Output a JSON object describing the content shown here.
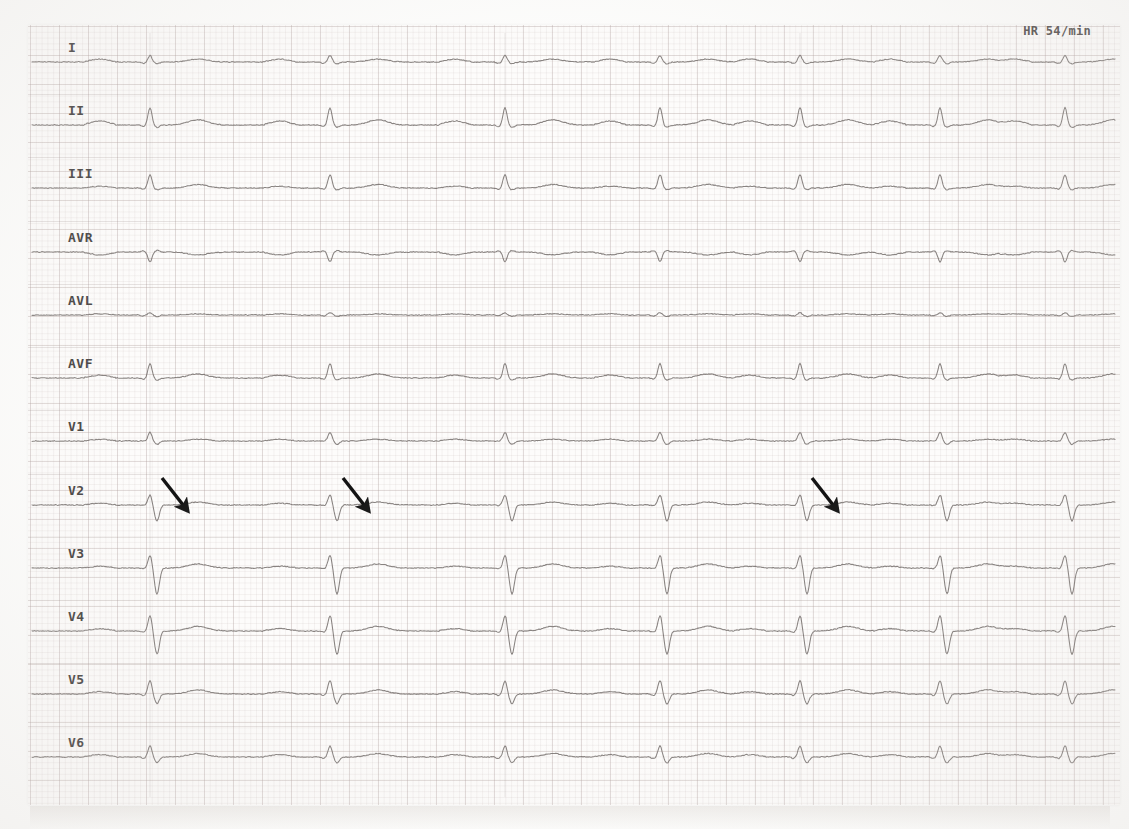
{
  "document": {
    "type": "12-lead electrocardiogram",
    "paper_background": "#fdfcfb",
    "grid_color": "#b0a09e",
    "trace_color": "#6b6563"
  },
  "annotations": {
    "heart_rate_label": "HR 54/min",
    "arrows": [
      {
        "name": "arrow-v2-beat1",
        "x": 162,
        "y": 478,
        "length": 42,
        "angle_deg": 52
      },
      {
        "name": "arrow-v2-beat2",
        "x": 343,
        "y": 478,
        "length": 42,
        "angle_deg": 52
      },
      {
        "name": "arrow-v2-beat4",
        "x": 812,
        "y": 478,
        "length": 42,
        "angle_deg": 52
      }
    ]
  },
  "leads": [
    {
      "name": "I",
      "label": "I",
      "baseline_y": 62,
      "label_y": 40
    },
    {
      "name": "II",
      "label": "II",
      "baseline_y": 125,
      "label_y": 103
    },
    {
      "name": "III",
      "label": "III",
      "baseline_y": 188,
      "label_y": 166
    },
    {
      "name": "aVR",
      "label": "AVR",
      "baseline_y": 252,
      "label_y": 230
    },
    {
      "name": "aVL",
      "label": "AVL",
      "baseline_y": 315,
      "label_y": 293
    },
    {
      "name": "aVF",
      "label": "AVF",
      "baseline_y": 378,
      "label_y": 356
    },
    {
      "name": "V1",
      "label": "V1",
      "baseline_y": 441,
      "label_y": 419
    },
    {
      "name": "V2",
      "label": "V2",
      "baseline_y": 505,
      "label_y": 483
    },
    {
      "name": "V3",
      "label": "V3",
      "baseline_y": 568,
      "label_y": 546
    },
    {
      "name": "V4",
      "label": "V4",
      "baseline_y": 631,
      "label_y": 609
    },
    {
      "name": "V5",
      "label": "V5",
      "baseline_y": 694,
      "label_y": 672
    },
    {
      "name": "V6",
      "label": "V6",
      "baseline_y": 757,
      "label_y": 735
    }
  ],
  "chart_data": {
    "type": "line",
    "xlabel": "time",
    "ylabel": "amplitude (mV)",
    "paper_speed": "25 mm/s",
    "gain": "10 mm/mV",
    "grid": true,
    "legend_position": "left-inline-labels",
    "heart_rate_bpm": 54,
    "beat_times_px": [
      150,
      330,
      505,
      660,
      800,
      940,
      1065
    ],
    "lead_label_x": 68,
    "trace_start_x": 32,
    "trace_end_x": 1115,
    "series": [
      {
        "name": "I",
        "p": 0.1,
        "q": -0.05,
        "r": 0.22,
        "s": -0.06,
        "t": 0.1
      },
      {
        "name": "II",
        "p": 0.14,
        "q": -0.05,
        "r": 0.6,
        "s": -0.08,
        "t": 0.18
      },
      {
        "name": "III",
        "p": 0.06,
        "q": -0.04,
        "r": 0.46,
        "s": -0.06,
        "t": 0.12
      },
      {
        "name": "aVR",
        "p": -0.1,
        "q": 0.04,
        "r": -0.34,
        "s": 0.05,
        "t": -0.1
      },
      {
        "name": "aVL",
        "p": 0.04,
        "q": -0.03,
        "r": 0.08,
        "s": -0.05,
        "t": 0.04
      },
      {
        "name": "aVF",
        "p": 0.1,
        "q": -0.04,
        "r": 0.5,
        "s": -0.07,
        "t": 0.14
      },
      {
        "name": "V1",
        "p": 0.06,
        "q": 0.0,
        "r": 0.3,
        "s": -0.12,
        "t": 0.06
      },
      {
        "name": "V2",
        "p": 0.06,
        "q": -0.02,
        "r": 0.34,
        "s": -0.55,
        "t": 0.1
      },
      {
        "name": "V3",
        "p": 0.06,
        "q": -0.02,
        "r": 0.42,
        "s": -0.9,
        "t": 0.14
      },
      {
        "name": "V4",
        "p": 0.08,
        "q": -0.04,
        "r": 0.52,
        "s": -0.8,
        "t": 0.16
      },
      {
        "name": "V5",
        "p": 0.08,
        "q": -0.05,
        "r": 0.46,
        "s": -0.34,
        "t": 0.14
      },
      {
        "name": "V6",
        "p": 0.08,
        "q": -0.05,
        "r": 0.38,
        "s": -0.2,
        "t": 0.12
      }
    ]
  }
}
